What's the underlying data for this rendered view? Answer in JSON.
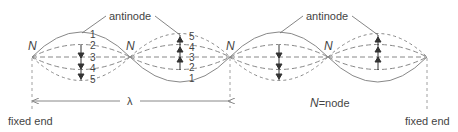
{
  "diagram": {
    "title": "",
    "labels": {
      "antinode": "antinode",
      "node_letter": "N",
      "node_legend": "=node",
      "wavelength": "λ",
      "fixed_end_left": "fixed end",
      "fixed_end_right": "fixed end"
    },
    "positions_numbered": [
      "1",
      "2",
      "3",
      "4",
      "5"
    ],
    "colors": {
      "line": "#777777",
      "text": "#444444"
    }
  }
}
